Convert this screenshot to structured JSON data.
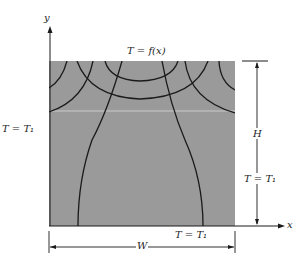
{
  "diagram": {
    "type": "2D heat conduction in rectangular plate with isotherms and heat-flow lines",
    "colors": {
      "plate_fill": "#9a9a9a",
      "line": "#1a1a1a",
      "background": "#ffffff"
    },
    "axes": {
      "x_label": "x",
      "y_label": "y"
    },
    "boundary_conditions": {
      "top": "T = f(x)",
      "left": "T = T₁",
      "right": "T = T₁",
      "bottom": "T = T₁"
    },
    "dimensions": {
      "width_label": "W",
      "height_label": "H"
    }
  }
}
